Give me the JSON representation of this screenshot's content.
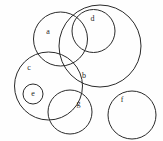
{
  "figure": {
    "background_color": "#fefefe",
    "stroke_color": "#2a2a2a",
    "label_color": "#1e1e1e",
    "width": 163,
    "height": 141
  },
  "chart_data": {
    "type": "diagram",
    "subtype": "euler-venn-circles",
    "title": "",
    "xlabel": "",
    "ylabel": "",
    "grid": false,
    "legend": "none",
    "xlim": [
      0,
      163
    ],
    "ylim": [
      0,
      141
    ],
    "circles": [
      {
        "id": "a",
        "label": "a",
        "cx": 60.5,
        "cy": 39.0,
        "r": 27.0,
        "label_x": 48.0,
        "label_y": 32.0
      },
      {
        "id": "b",
        "label": "b",
        "cx": 100.0,
        "cy": 46.0,
        "r": 41.0,
        "label_x": 84.0,
        "label_y": 76.0
      },
      {
        "id": "c",
        "label": "c",
        "cx": 48.5,
        "cy": 86.0,
        "r": 34.0,
        "label_x": 29.0,
        "label_y": 68.0
      },
      {
        "id": "d",
        "label": "d",
        "cx": 93.5,
        "cy": 31.0,
        "r": 21.5,
        "label_x": 92.5,
        "label_y": 19.0
      },
      {
        "id": "e",
        "label": "e",
        "cx": 33.0,
        "cy": 94.0,
        "r": 10.0,
        "label_x": 33.0,
        "label_y": 94.0
      },
      {
        "id": "f",
        "label": "f",
        "cx": 132.0,
        "cy": 115.0,
        "r": 24.0,
        "label_x": 122.0,
        "label_y": 100.0
      },
      {
        "id": "g",
        "label": "g",
        "cx": 70.0,
        "cy": 112.0,
        "r": 22.0,
        "label_x": 78.5,
        "label_y": 104.0
      }
    ],
    "labels": [
      "a",
      "b",
      "c",
      "d",
      "e",
      "f",
      "g"
    ]
  }
}
